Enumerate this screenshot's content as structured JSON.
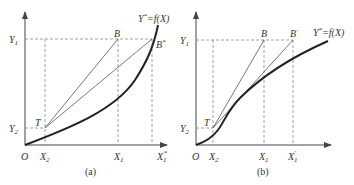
{
  "panels": [
    {
      "id": "a",
      "caption": "(a)",
      "origin_label": "O",
      "curve_label": "Y*=f(X)",
      "curve_shape": "convex",
      "y_labels": {
        "y1": "Y1",
        "y2": "Y2"
      },
      "x_labels": {
        "x2": "X2",
        "x1": "X1",
        "x1p": "X1*"
      },
      "points": {
        "T": "T",
        "B": "B",
        "Bp": "B*"
      }
    },
    {
      "id": "b",
      "caption": "(b)",
      "origin_label": "O",
      "curve_label": "Y*=f(X)",
      "curve_shape": "concave",
      "y_labels": {
        "y1": "Y1",
        "y2": "Y2"
      },
      "x_labels": {
        "x2": "X2",
        "x1": "X1",
        "x1p": "X1'"
      },
      "points": {
        "T": "T",
        "B": "B",
        "Bp": "B'"
      }
    }
  ],
  "text": {
    "a_Y": "Y",
    "a_Y1sub": "1",
    "a_Y2sub": "2",
    "a_X": "X",
    "a_X2sub": "2",
    "a_X1sub": "1",
    "a_X1psub": "1",
    "a_X1psup": "*",
    "a_T": "T",
    "a_B": "B",
    "a_Bp": "B",
    "a_Bpsup": "*",
    "a_curve": "Y",
    "a_curve_sup": "*",
    "a_curve_rest": "=f(X)",
    "a_O": "O",
    "a_caption": "(a)",
    "b_Y": "Y",
    "b_Y1sub": "1",
    "b_Y2sub": "2",
    "b_X": "X",
    "b_X2sub": "2",
    "b_X1sub": "1",
    "b_X1psub": "1",
    "b_X1psup": "'",
    "b_T": "T",
    "b_B": "B",
    "b_Bp": "B",
    "b_Bpsup": "'",
    "b_curve": "Y",
    "b_curve_sup": "*",
    "b_curve_rest": "=f(X)",
    "b_O": "O",
    "b_caption": "(b)"
  }
}
